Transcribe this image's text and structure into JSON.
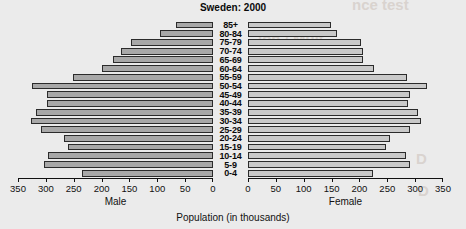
{
  "chart_data": {
    "type": "bar",
    "subtype": "population-pyramid",
    "title": "Sweden: 2000",
    "xlabel": "Population (in thousands)",
    "ylabel": "",
    "categories": [
      "85+",
      "80-84",
      "75-79",
      "70-74",
      "65-69",
      "60-64",
      "55-59",
      "50-54",
      "45-49",
      "40-44",
      "35-39",
      "30-34",
      "25-29",
      "20-24",
      "15-19",
      "10-14",
      "5-9",
      "0-4"
    ],
    "series": [
      {
        "name": "Male",
        "side": "left",
        "axis_ticks": [
          350,
          300,
          250,
          200,
          150,
          100,
          50,
          0
        ],
        "axis_direction": "reversed",
        "xlim": [
          0,
          350
        ],
        "values": [
          66,
          95,
          147,
          165,
          180,
          200,
          252,
          325,
          298,
          298,
          318,
          327,
          309,
          268,
          260,
          296,
          303,
          236
        ]
      },
      {
        "name": "Female",
        "side": "right",
        "axis_ticks": [
          0,
          50,
          100,
          150,
          200,
          250,
          300,
          350
        ],
        "axis_direction": "normal",
        "xlim": [
          0,
          350
        ],
        "values": [
          149,
          160,
          203,
          206,
          206,
          227,
          285,
          322,
          290,
          288,
          305,
          311,
          290,
          255,
          247,
          283,
          290,
          225
        ]
      }
    ],
    "grid": false,
    "legend": "none",
    "bar_fill_male": "#a8a8a8",
    "bar_fill_female": "#c9c9c9",
    "bar_stroke": "#2b2b2b",
    "background": "#ebebeb"
  },
  "header": {
    "title": "Sweden: 2000"
  },
  "axes": {
    "male_label": "Male",
    "female_label": "Female",
    "x_title": "Population (in thousands)"
  },
  "background_bleed": {
    "line1": "nce test",
    "line2": "ion / Mult",
    "line3": "D",
    "line4": "D"
  }
}
